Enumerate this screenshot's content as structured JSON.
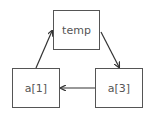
{
  "diagram": {
    "nodes": [
      {
        "id": "temp",
        "label": "temp",
        "x": 53,
        "y": 10,
        "w": 47,
        "h": 40
      },
      {
        "id": "a1",
        "label": "a[1]",
        "x": 12,
        "y": 68,
        "w": 48,
        "h": 40
      },
      {
        "id": "a3",
        "label": "a[3]",
        "x": 95,
        "y": 68,
        "w": 48,
        "h": 40
      }
    ],
    "edges": [
      {
        "from": "a[1]",
        "to": "temp"
      },
      {
        "from": "temp",
        "to": "a[3]"
      },
      {
        "from": "a[3]",
        "to": "a[1]"
      }
    ],
    "colors": {
      "stroke": "#555555",
      "text": "#555555",
      "background": "#ffffff"
    }
  }
}
